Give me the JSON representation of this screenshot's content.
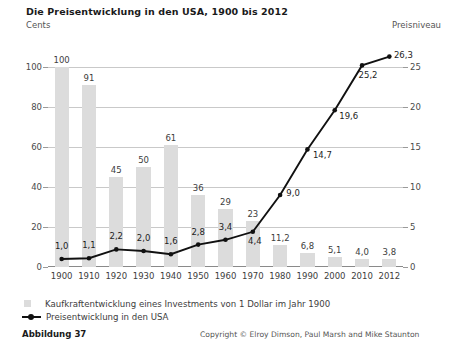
{
  "title": "Die Preisentwicklung in den USA, 1900 bis 2012",
  "axis_label_left": "Cents",
  "axis_label_right": "Preisniveau",
  "legend": {
    "bars": "Kaufkraftentwicklung eines Investments von 1 Dollar im Jahr 1900",
    "line": "Preisentwicklung in den USA"
  },
  "footer": {
    "figure": "Abbildung 37",
    "copyright": "Copyright © Elroy Dimson, Paul Marsh and Mike Staunton"
  },
  "colors": {
    "bar": "#dcdcdc",
    "line": "#111111",
    "grid": "#c9c9c9",
    "text": "#3d3d3d"
  },
  "chart_data": {
    "type": "bar",
    "title": "Die Preisentwicklung in den USA, 1900 bis 2012",
    "xlabel": "",
    "ylabel": "Cents",
    "ylabel_right": "Preisniveau",
    "categories": [
      "1900",
      "1910",
      "1920",
      "1930",
      "1940",
      "1950",
      "1960",
      "1970",
      "1980",
      "1990",
      "2000",
      "2010",
      "2012"
    ],
    "ylim": [
      0,
      100
    ],
    "ylim_right": [
      0,
      25
    ],
    "yticks": [
      0,
      20,
      40,
      60,
      80,
      100
    ],
    "yticks_right": [
      0,
      5,
      10,
      15,
      20,
      25
    ],
    "grid": true,
    "legend_position": "bottom-left",
    "series": [
      {
        "name": "Kaufkraftentwicklung eines Investments von 1 Dollar im Jahr 1900",
        "type": "bar",
        "axis": "left",
        "values": [
          100,
          91,
          45,
          50,
          61,
          36,
          29,
          23,
          11.2,
          6.8,
          5.1,
          4.0,
          3.8
        ],
        "labels": [
          "100",
          "91",
          "45",
          "50",
          "61",
          "36",
          "29",
          "23",
          "11,2",
          "6,8",
          "5,1",
          "4,0",
          "3,8"
        ]
      },
      {
        "name": "Preisentwicklung in den USA",
        "type": "line",
        "axis": "right",
        "values": [
          1.0,
          1.1,
          2.2,
          2.0,
          1.6,
          2.8,
          3.4,
          4.4,
          9.0,
          14.7,
          19.6,
          25.2,
          26.3
        ],
        "labels": [
          "1,0",
          "1,1",
          "2,2",
          "2,0",
          "1,6",
          "2,8",
          "3,4",
          "4,4",
          "9,0",
          "14,7",
          "19,6",
          "25,2",
          "26,3"
        ]
      }
    ]
  }
}
